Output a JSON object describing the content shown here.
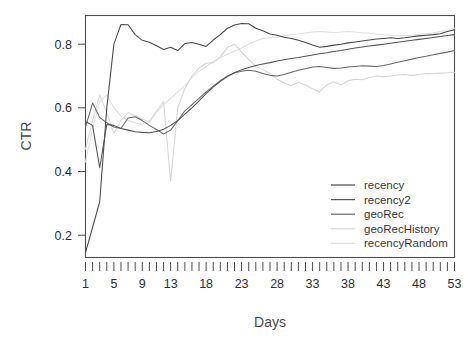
{
  "chart_data": {
    "type": "line",
    "title": "",
    "xlabel": "Days",
    "ylabel": "CTR",
    "xlim": [
      1,
      53
    ],
    "ylim": [
      0.13,
      0.89
    ],
    "grid": false,
    "legend_position": "bottom-right",
    "y_ticks": [
      "0.2",
      "0.4",
      "0.6",
      "0.8"
    ],
    "y_tick_values": [
      0.2,
      0.4,
      0.6,
      0.8
    ],
    "x_ticks": [
      "1",
      "5",
      "9",
      "13",
      "18",
      "23",
      "28",
      "33",
      "38",
      "43",
      "48",
      "53"
    ],
    "x_tick_values": [
      1,
      5,
      9,
      13,
      18,
      23,
      28,
      33,
      38,
      43,
      48,
      53
    ],
    "x_minor_tick_values": [
      1,
      2,
      3,
      4,
      5,
      6,
      7,
      8,
      9,
      10,
      11,
      12,
      13,
      14,
      15,
      16,
      17,
      18,
      19,
      20,
      21,
      22,
      23,
      24,
      25,
      26,
      27,
      28,
      29,
      30,
      31,
      32,
      33,
      34,
      35,
      36,
      37,
      38,
      39,
      40,
      41,
      42,
      43,
      44,
      45,
      46,
      47,
      48,
      49,
      50,
      51,
      52,
      53
    ],
    "x": [
      1,
      2,
      3,
      4,
      5,
      6,
      7,
      8,
      9,
      10,
      11,
      12,
      13,
      14,
      15,
      16,
      17,
      18,
      19,
      20,
      21,
      22,
      23,
      24,
      25,
      26,
      27,
      28,
      29,
      30,
      31,
      32,
      33,
      34,
      35,
      36,
      37,
      38,
      39,
      40,
      41,
      42,
      43,
      44,
      45,
      46,
      47,
      48,
      49,
      50,
      51,
      52,
      53
    ],
    "series": [
      {
        "name": "recency",
        "color": "#4a4a4a",
        "values": [
          0.145,
          0.225,
          0.305,
          0.6,
          0.8,
          0.862,
          0.861,
          0.83,
          0.812,
          0.806,
          0.795,
          0.783,
          0.79,
          0.78,
          0.802,
          0.805,
          0.8,
          0.793,
          0.813,
          0.83,
          0.85,
          0.86,
          0.865,
          0.864,
          0.85,
          0.842,
          0.832,
          0.828,
          0.822,
          0.818,
          0.812,
          0.805,
          0.797,
          0.79,
          0.793,
          0.797,
          0.8,
          0.804,
          0.807,
          0.81,
          0.813,
          0.816,
          0.818,
          0.82,
          0.818,
          0.82,
          0.823,
          0.826,
          0.828,
          0.83,
          0.833,
          0.84,
          0.845
        ]
      },
      {
        "name": "recency2",
        "color": "#565656",
        "values": [
          0.557,
          0.545,
          0.412,
          0.548,
          0.545,
          0.535,
          0.53,
          0.525,
          0.523,
          0.522,
          0.526,
          0.533,
          0.545,
          0.56,
          0.58,
          0.6,
          0.622,
          0.645,
          0.665,
          0.683,
          0.698,
          0.71,
          0.72,
          0.727,
          0.733,
          0.738,
          0.742,
          0.747,
          0.751,
          0.755,
          0.758,
          0.762,
          0.766,
          0.77,
          0.773,
          0.777,
          0.78,
          0.784,
          0.788,
          0.791,
          0.794,
          0.797,
          0.8,
          0.803,
          0.806,
          0.809,
          0.812,
          0.815,
          0.818,
          0.821,
          0.824,
          0.827,
          0.83
        ]
      },
      {
        "name": "geoRec",
        "color": "#6a6a6a",
        "values": [
          0.54,
          0.615,
          0.57,
          0.553,
          0.54,
          0.535,
          0.568,
          0.572,
          0.56,
          0.545,
          0.532,
          0.518,
          0.53,
          0.56,
          0.59,
          0.61,
          0.63,
          0.65,
          0.668,
          0.685,
          0.7,
          0.71,
          0.715,
          0.718,
          0.715,
          0.708,
          0.702,
          0.7,
          0.705,
          0.712,
          0.718,
          0.723,
          0.728,
          0.73,
          0.727,
          0.724,
          0.725,
          0.728,
          0.73,
          0.732,
          0.731,
          0.73,
          0.733,
          0.738,
          0.743,
          0.748,
          0.753,
          0.758,
          0.762,
          0.767,
          0.771,
          0.775,
          0.78
        ]
      },
      {
        "name": "geoRecHistory",
        "color": "#d6d6d6",
        "values": [
          0.47,
          0.56,
          0.64,
          0.585,
          0.52,
          0.56,
          0.585,
          0.575,
          0.565,
          0.555,
          0.59,
          0.62,
          0.37,
          0.6,
          0.66,
          0.7,
          0.725,
          0.74,
          0.742,
          0.76,
          0.79,
          0.8,
          0.775,
          0.752,
          0.73,
          0.72,
          0.708,
          0.69,
          0.678,
          0.67,
          0.68,
          0.672,
          0.66,
          0.65,
          0.672,
          0.682,
          0.672,
          0.685,
          0.69,
          0.688,
          0.695,
          0.7,
          0.698,
          0.7,
          0.703,
          0.705,
          0.702,
          0.705,
          0.708,
          0.707,
          0.709,
          0.71,
          0.712
        ]
      },
      {
        "name": "recencyRandom",
        "color": "#e0e0e0",
        "values": [
          0.43,
          0.535,
          0.62,
          0.64,
          0.6,
          0.575,
          0.56,
          0.553,
          0.548,
          0.56,
          0.585,
          0.61,
          0.63,
          0.65,
          0.67,
          0.695,
          0.715,
          0.73,
          0.745,
          0.758,
          0.768,
          0.778,
          0.788,
          0.8,
          0.81,
          0.818,
          0.82,
          0.822,
          0.826,
          0.83,
          0.832,
          0.835,
          0.838,
          0.84,
          0.838,
          0.836,
          0.838,
          0.84,
          0.838,
          0.836,
          0.834,
          0.832,
          0.83,
          0.828,
          0.827,
          0.826,
          0.828,
          0.83,
          0.832,
          0.836,
          0.84,
          0.844,
          0.85
        ]
      }
    ],
    "legend_entries": [
      {
        "label": "recency",
        "color": "#4a4a4a"
      },
      {
        "label": "recency2",
        "color": "#565656"
      },
      {
        "label": "geoRec",
        "color": "#6a6a6a"
      },
      {
        "label": "geoRecHistory",
        "color": "#d6d6d6"
      },
      {
        "label": "recencyRandom",
        "color": "#e0e0e0"
      }
    ]
  }
}
